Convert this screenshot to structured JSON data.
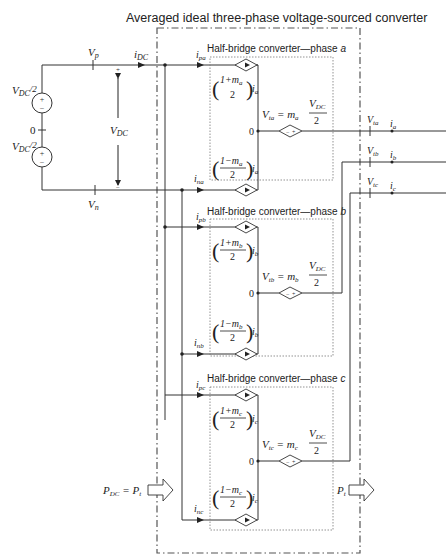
{
  "title": "Averaged ideal three-phase voltage-sourced converter",
  "dc_side": {
    "vp_label": "V",
    "vp_sub": "p",
    "vn_label": "V",
    "vn_sub": "n",
    "idc_label": "i",
    "idc_sub": "DC",
    "vdc_label": "V",
    "vdc_sub": "DC",
    "source_top_label": "V",
    "source_top_sub": "DC",
    "source_top_suffix": "/2",
    "source_bottom_label": "V",
    "source_bottom_sub": "DC",
    "source_bottom_suffix": "/2",
    "midpoint_label": "0",
    "plus": "+",
    "minus": "−",
    "power_in_label": "P",
    "power_in_sub": "DC",
    "power_in_eq": " = P",
    "power_in_eq_sub": "t"
  },
  "phases": [
    {
      "id": "a",
      "box_title": "Half-bridge converter—phase ",
      "box_phase": "a",
      "ip_label": "i",
      "ip_sub": "pa",
      "in_label": "i",
      "in_sub": "na",
      "upper_num": "1+m",
      "upper_m_sub": "a",
      "lower_num": "1−m",
      "lower_m_sub": "a",
      "den": "2",
      "current": "i",
      "current_sub": "a",
      "vt_eq_left": "V",
      "vt_eq_sub": "ta",
      "vt_eq_mid": " = m",
      "vt_eq_m_sub": "a",
      "vt_num": "V",
      "vt_num_sub": "DC",
      "vt_den": "2",
      "zero": "0",
      "out_v_label": "V",
      "out_v_sub": "ta",
      "out_i_label": "i",
      "out_i_sub": "a"
    },
    {
      "id": "b",
      "box_title": "Half-bridge converter—phase ",
      "box_phase": "b",
      "ip_label": "i",
      "ip_sub": "pb",
      "in_label": "i",
      "in_sub": "nb",
      "upper_num": "1+m",
      "upper_m_sub": "b",
      "lower_num": "1−m",
      "lower_m_sub": "b",
      "den": "2",
      "current": "i",
      "current_sub": "b",
      "vt_eq_left": "V",
      "vt_eq_sub": "tb",
      "vt_eq_mid": " = m",
      "vt_eq_m_sub": "b",
      "vt_num": "V",
      "vt_num_sub": "DC",
      "vt_den": "2",
      "zero": "0",
      "out_v_label": "V",
      "out_v_sub": "tb",
      "out_i_label": "i",
      "out_i_sub": "b"
    },
    {
      "id": "c",
      "box_title": "Half-bridge converter—phase ",
      "box_phase": "c",
      "ip_label": "i",
      "ip_sub": "pc",
      "in_label": "i",
      "in_sub": "nc",
      "upper_num": "1+m",
      "upper_m_sub": "c",
      "lower_num": "1−m",
      "lower_m_sub": "c",
      "den": "2",
      "current": "i",
      "current_sub": "c",
      "vt_eq_left": "V",
      "vt_eq_sub": "tc",
      "vt_eq_mid": " = m",
      "vt_eq_m_sub": "c",
      "vt_num": "V",
      "vt_num_sub": "DC",
      "vt_den": "2",
      "zero": "0",
      "out_v_label": "V",
      "out_v_sub": "tc",
      "out_i_label": "i",
      "out_i_sub": "c"
    }
  ],
  "ac_side": {
    "power_out_label": "P",
    "power_out_sub": "t"
  },
  "colors": {
    "line": "#333333",
    "dash_box": "#555555",
    "dotted_box": "#777777",
    "text": "#222222"
  }
}
